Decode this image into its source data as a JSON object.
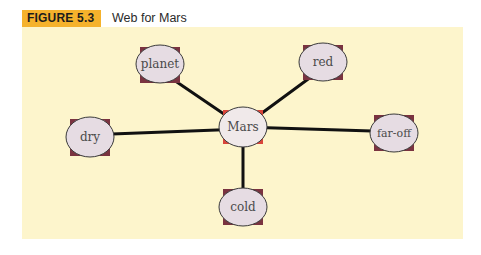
{
  "figure": {
    "label": "FIGURE 5.3",
    "title": "Web for Mars"
  },
  "colors": {
    "label_bg": "#f5b22c",
    "panel_bg": "#fdf5cc",
    "node_fill": "#e6dce3",
    "center_fill": "#f0e9ea",
    "node_corner": "#7a3340",
    "center_corner": "#d9453a",
    "edge": "#111111"
  },
  "web": {
    "center": {
      "label": "Mars"
    },
    "nodes": [
      {
        "label": "planet"
      },
      {
        "label": "red"
      },
      {
        "label": "dry"
      },
      {
        "label": "far-off"
      },
      {
        "label": "cold"
      }
    ]
  }
}
